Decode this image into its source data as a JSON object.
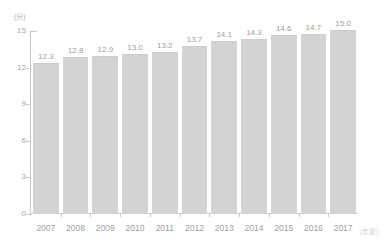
{
  "chart_data": {
    "type": "bar",
    "title": "",
    "subtitle": "",
    "xlabel": "(年度)",
    "ylabel": "(分)",
    "categories": [
      "2007",
      "2008",
      "2009",
      "2010",
      "2011",
      "2012",
      "2013",
      "2014",
      "2015",
      "2016",
      "2017"
    ],
    "values": [
      12.3,
      12.8,
      12.9,
      13.0,
      13.2,
      13.7,
      14.1,
      14.3,
      14.6,
      14.7,
      15.0
    ],
    "value_labels": [
      "12.3",
      "12.8",
      "12.9",
      "13.0",
      "13.2",
      "13.7",
      "14.1",
      "14.3",
      "14.6",
      "14.7",
      "15.0"
    ],
    "ylim": [
      0,
      15
    ],
    "yticks": [
      0,
      3,
      6,
      9,
      12,
      15
    ],
    "ytick_labels": [
      "0",
      "3",
      "6",
      "9",
      "12",
      "15"
    ],
    "grid": false,
    "legend": false,
    "legend_position": "none",
    "bar_color": "#d3d3d3",
    "axis_color": "#c9c9c9",
    "text_color": "#a0a0a0"
  }
}
